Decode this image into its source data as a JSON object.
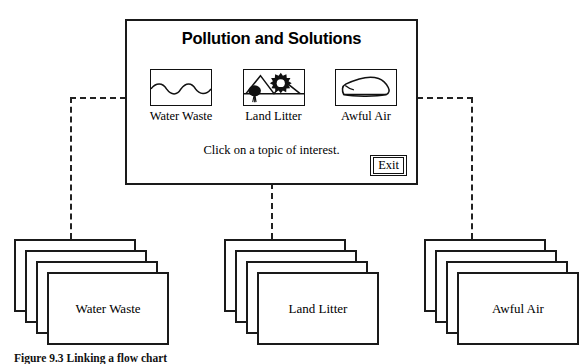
{
  "panel": {
    "title": "Pollution and Solutions",
    "prompt": "Click on a topic of interest.",
    "exit_label": "Exit"
  },
  "topics": [
    {
      "label": "Water Waste",
      "icon": "water-waves-icon"
    },
    {
      "label": "Land Litter",
      "icon": "land-mountains-sun-tree-icon"
    },
    {
      "label": "Awful Air",
      "icon": "car-vehicle-icon"
    }
  ],
  "stacks": [
    {
      "label": "Water Waste",
      "cards": 4
    },
    {
      "label": "Land Litter",
      "cards": 4
    },
    {
      "label": "Awful Air",
      "cards": 4
    }
  ],
  "caption": "Figure 9.3  Linking a flow chart",
  "colors": {
    "line": "#1a1a1a",
    "dashed": "#222222",
    "background": "#ffffff"
  }
}
